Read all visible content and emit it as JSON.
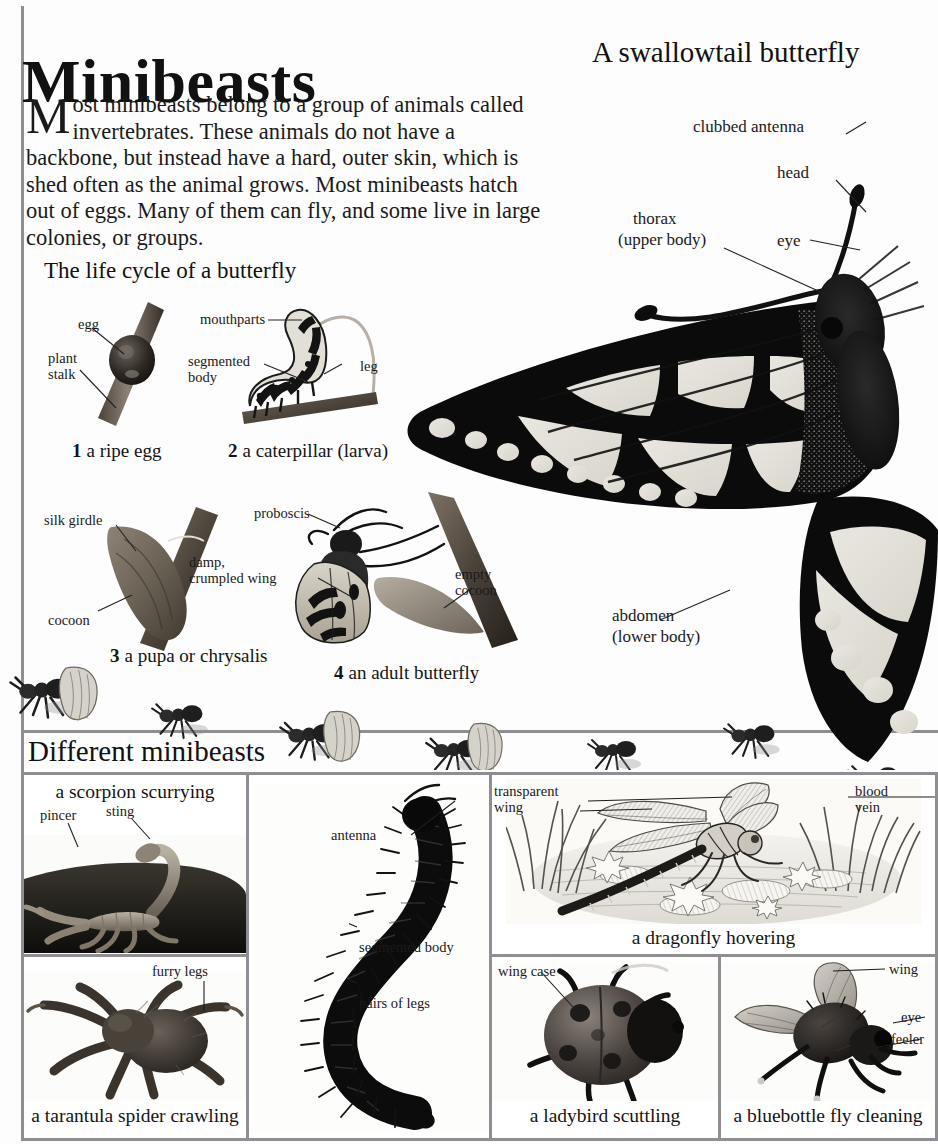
{
  "page": {
    "title": "Minibeasts",
    "subtitle": "A swallowtail butterfly",
    "intro_dropcap": "M",
    "intro_body": "ost minibeasts belong to a group of animals called invertebrates. These animals do not have a backbone, but instead have a hard, outer skin, which is shed often as the animal grows. Most minibeasts hatch out of eggs. Many of them can fly, and some live in large colonies, or groups.",
    "lifecycle_heading": "The life cycle of a butterfly",
    "different_heading": "Different minibeasts"
  },
  "butterfly_labels": {
    "clubbed_antenna": "clubbed antenna",
    "head": "head",
    "thorax_line1": "thorax",
    "thorax_line2": "(upper body)",
    "eye": "eye",
    "abdomen_line1": "abdomen",
    "abdomen_line2": "(lower body)"
  },
  "lifecycle": [
    {
      "number": "1",
      "caption": "a ripe egg",
      "labels": [
        "egg",
        "plant\nstalk"
      ]
    },
    {
      "number": "2",
      "caption": "a caterpillar (larva)",
      "labels": [
        "mouthparts",
        "segmented\nbody",
        "leg"
      ]
    },
    {
      "number": "3",
      "caption": "a pupa or chrysalis",
      "labels": [
        "silk girdle",
        "cocoon"
      ]
    },
    {
      "number": "4",
      "caption": "an adult butterfly",
      "labels": [
        "proboscis",
        "damp,\ncrumpled wing",
        "empty\ncocoon"
      ]
    }
  ],
  "minibeasts": {
    "scorpion": {
      "caption": "a scorpion scurrying",
      "labels": [
        "pincer",
        "sting"
      ]
    },
    "tarantula": {
      "caption": "a tarantula spider crawling",
      "labels": [
        "furry legs"
      ]
    },
    "millipede": {
      "caption": "a millipede wriggling",
      "labels": [
        "antenna",
        "segmented body",
        "pairs of legs"
      ]
    },
    "dragonfly": {
      "caption": "a dragonfly hovering",
      "labels": [
        "transparent\nwing",
        "blood\nvein"
      ]
    },
    "ladybird": {
      "caption": "a ladybird scuttling",
      "labels": [
        "wing case"
      ]
    },
    "bluebottle": {
      "caption": "a bluebottle fly cleaning",
      "labels": [
        "wing",
        "eye",
        "feeler"
      ]
    }
  },
  "colors": {
    "rule": "#8e8e93",
    "ink": "#1a1a1a",
    "paper": "#fdfdfd"
  }
}
